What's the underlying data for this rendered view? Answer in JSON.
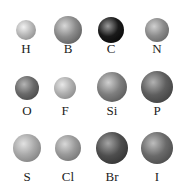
{
  "atoms": [
    {
      "symbol": "H",
      "cx": 26,
      "cy": 30,
      "r": 10,
      "base": "#b8b8b8",
      "light": "#f2f2f2",
      "dark": "#7a7a7a",
      "ly": 42
    },
    {
      "symbol": "B",
      "cx": 68,
      "cy": 30,
      "r": 14,
      "base": "#8a8a8a",
      "light": "#d8d8d8",
      "dark": "#4a4a4a",
      "ly": 42
    },
    {
      "symbol": "C",
      "cx": 111,
      "cy": 30,
      "r": 13,
      "base": "#1a1a1a",
      "light": "#9a9a9a",
      "dark": "#000000",
      "ly": 42
    },
    {
      "symbol": "N",
      "cx": 157,
      "cy": 30,
      "r": 12,
      "base": "#8c8c8c",
      "light": "#d0d0d0",
      "dark": "#555555",
      "ly": 42
    },
    {
      "symbol": "O",
      "cx": 27,
      "cy": 88,
      "r": 12,
      "base": "#6a6a6a",
      "light": "#b5b5b5",
      "dark": "#3a3a3a",
      "ly": 104
    },
    {
      "symbol": "F",
      "cx": 65,
      "cy": 88,
      "r": 11,
      "base": "#b0b0b0",
      "light": "#e8e8e8",
      "dark": "#777777",
      "ly": 104
    },
    {
      "symbol": "Si",
      "cx": 112,
      "cy": 87,
      "r": 15,
      "base": "#7e7e7e",
      "light": "#cfcfcf",
      "dark": "#474747",
      "ly": 104
    },
    {
      "symbol": "P",
      "cx": 157,
      "cy": 87,
      "r": 16,
      "base": "#5e5e5e",
      "light": "#b2b2b2",
      "dark": "#333333",
      "ly": 104
    },
    {
      "symbol": "S",
      "cx": 27,
      "cy": 148,
      "r": 14,
      "base": "#a8a8a8",
      "light": "#e2e2e2",
      "dark": "#6e6e6e",
      "ly": 170
    },
    {
      "symbol": "Cl",
      "cx": 68,
      "cy": 148,
      "r": 13,
      "base": "#9a9a9a",
      "light": "#d8d8d8",
      "dark": "#646464",
      "ly": 170
    },
    {
      "symbol": "Br",
      "cx": 112,
      "cy": 148,
      "r": 16,
      "base": "#4e4e4e",
      "light": "#a4a4a4",
      "dark": "#262626",
      "ly": 170
    },
    {
      "symbol": "I",
      "cx": 157,
      "cy": 148,
      "r": 16,
      "base": "#6a6a6a",
      "light": "#bdbdbd",
      "dark": "#3c3c3c",
      "ly": 170
    }
  ]
}
